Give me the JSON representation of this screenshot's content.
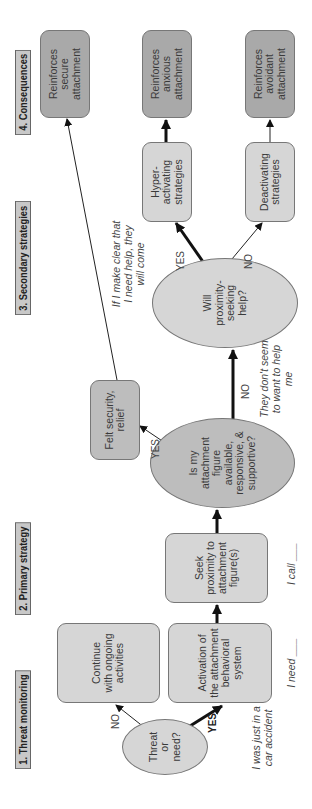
{
  "sections": [
    {
      "id": "threat-monitoring",
      "label": "1. Threat monitoring"
    },
    {
      "id": "primary-strategy",
      "label": "2. Primary strategy"
    },
    {
      "id": "secondary-strategies",
      "label": "3. Secondary strategies"
    },
    {
      "id": "consequences",
      "label": "4. Consequences"
    }
  ],
  "nodes": {
    "threat": "Threat or need?",
    "continue": "Continue with ongoing activities",
    "activation": "Activation of the attachment behavioral system",
    "seek": "Seek proximity to attachment figure(s)",
    "available": "Is my attachment figure available, responsive, & supportive?",
    "felt_security": "Felt security, relief",
    "will_help": "Will proximity-seeking help?",
    "hyper": "Hyper-activating strategies",
    "deactivating": "Deactivating strategies",
    "secure": "Reinforces secure attachment",
    "anxious": "Reinforces anxious attachment",
    "avoidant": "Reinforces avoidant attachment"
  },
  "edge_labels": {
    "threat_no": "NO",
    "threat_yes": "YES",
    "available_yes": "YES",
    "available_no": "NO",
    "will_yes": "YES",
    "will_no": "NO"
  },
  "notes": {
    "car_accident": "I was just in a car accident",
    "i_need": "I need ___",
    "i_call": "I call ___",
    "dont_want": "They don't seem to want to help me",
    "make_clear": "If I make clear that I need help, they will come"
  },
  "colors": {
    "light_fill": "#d6d6d6",
    "mid_fill": "#bdbdbd",
    "dark_fill": "#a9a9a9",
    "section_fill": "#c8c8c8",
    "stroke": "#222222"
  }
}
